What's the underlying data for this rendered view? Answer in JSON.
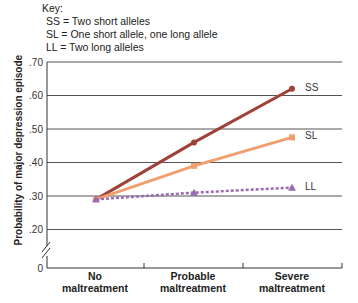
{
  "key": {
    "title": "Key:",
    "items": [
      "SS = Two short alleles",
      "SL = One short allele, one long allele",
      "LL = Two long alleles"
    ]
  },
  "chart_data": {
    "type": "line",
    "title": "",
    "xlabel": "",
    "ylabel": "Probability of major depression episode",
    "categories": [
      "No maltreatment",
      "Probable maltreatment",
      "Severe maltreatment"
    ],
    "y_ticks": [
      ".70",
      ".60",
      ".50",
      ".40",
      ".30",
      ".20",
      "0"
    ],
    "ylim": [
      0,
      0.7
    ],
    "axis_break": true,
    "grid": true,
    "series": [
      {
        "name": "SS",
        "values": [
          0.29,
          0.46,
          0.62
        ],
        "color": "#a0413a",
        "style": "solid",
        "marker": "circle"
      },
      {
        "name": "SL",
        "values": [
          0.29,
          0.39,
          0.475
        ],
        "color": "#f0a070",
        "style": "solid",
        "marker": "square"
      },
      {
        "name": "LL",
        "values": [
          0.29,
          0.31,
          0.325
        ],
        "color": "#9a6bb0",
        "style": "dotted",
        "marker": "triangle"
      }
    ]
  }
}
